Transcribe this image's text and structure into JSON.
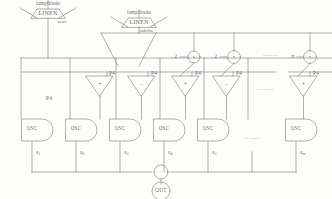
{
  "diagram": {
    "line_color": "#7c7c79",
    "text_color": "#6b6b68"
  },
  "generators": [
    {
      "name": "amplitude-envelope-left",
      "top_label": "iamplitude",
      "block_label": "LINEN",
      "out_label": "aenv"
    },
    {
      "name": "amplitude-envelope-right",
      "top_label": "iamplitude",
      "block_label": "LINEN",
      "out_label": "iadelta"
    }
  ],
  "multipliers": [
    {
      "name": "mult-1",
      "factor": "2",
      "op": "x"
    },
    {
      "name": "mult-2",
      "factor": "2",
      "op": "x"
    },
    {
      "name": "mult-n",
      "factor": "n",
      "op": "x"
    }
  ],
  "adders": [
    {
      "name": "p4-osc-1",
      "label": "P4",
      "sign": ""
    },
    {
      "name": "p4-osc-2",
      "label": "P4",
      "sign": "+"
    },
    {
      "name": "p4-osc-3",
      "label": "P4",
      "sign": "-"
    },
    {
      "name": "p4-osc-4",
      "label": "P4",
      "sign": "+"
    },
    {
      "name": "p4-osc-5",
      "label": "P4",
      "sign": "-"
    },
    {
      "name": "p4-osc-n",
      "label": "P4",
      "sign": "+"
    }
  ],
  "oscillators": [
    {
      "name": "osc-1",
      "label": "OSC",
      "out": "a",
      "index": "1"
    },
    {
      "name": "osc-2",
      "label": "OSC",
      "out": "a",
      "index": "2"
    },
    {
      "name": "osc-3",
      "label": "OSC",
      "out": "a",
      "index": "3"
    },
    {
      "name": "osc-4",
      "label": "OSC",
      "out": "a",
      "index": "4"
    },
    {
      "name": "osc-5",
      "label": "OSC",
      "out": "a",
      "index": "5"
    },
    {
      "name": "osc-n",
      "label": "OSC",
      "out": "a",
      "index": "m"
    }
  ],
  "summing": {
    "name": "mixer",
    "op": "+"
  },
  "output": {
    "name": "output-node",
    "label": "OUT"
  },
  "ellipses": {
    "bus_row": "......",
    "adder_row": "......",
    "osc_row": "......"
  }
}
